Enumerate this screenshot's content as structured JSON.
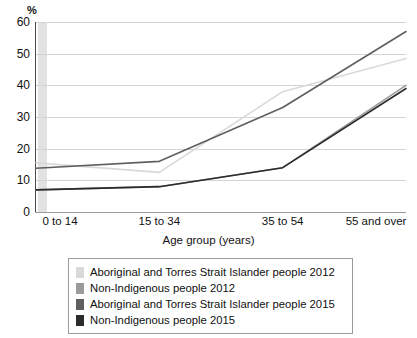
{
  "chart_data": {
    "type": "line",
    "title": "",
    "xlabel": "Age group (years)",
    "ylabel": "%",
    "categories": [
      "0 to 14",
      "15 to 34",
      "35 to 54",
      "55 and over"
    ],
    "ylim": [
      0,
      60
    ],
    "ytick_step": 10,
    "yticks": [
      "60",
      "50",
      "40",
      "30",
      "20",
      "10",
      "0"
    ],
    "grid": "horizontal",
    "legend_position": "bottom",
    "series": [
      {
        "name": "Aboriginal and Torres Strait Islander people 2012",
        "color": "#d9d9d9",
        "values": [
          15.5,
          12.5,
          38.0,
          48.5
        ]
      },
      {
        "name": "Non-Indigenous people 2012",
        "color": "#9a9a9a",
        "values": [
          7.0,
          8.0,
          14.0,
          40.0
        ]
      },
      {
        "name": "Aboriginal and Torres Strait Islander people 2015",
        "color": "#5f5f5f",
        "values": [
          13.8,
          16.0,
          33.0,
          57.0
        ]
      },
      {
        "name": "Non-Indigenous people 2015",
        "color": "#2b2b2b",
        "values": [
          7.0,
          8.0,
          14.0,
          39.0
        ]
      }
    ]
  },
  "axis": {
    "unit_label": "%",
    "x_title": "Age group (years)"
  },
  "colors": {
    "gridline": "#d4d4d4",
    "axis": "#4a4a4a",
    "left_band": "#e2e2e2",
    "legend_border": "#9b9b9b",
    "background": "#ffffff"
  }
}
